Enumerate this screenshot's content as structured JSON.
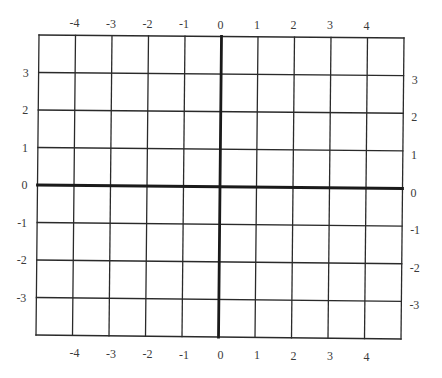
{
  "diagram": {
    "type": "coordinate-grid",
    "columns": 10,
    "rows": 8,
    "colors": {
      "background": "#ffffff",
      "grid_line": "#2a2a2a",
      "axis_line": "#1a1a1a",
      "label": "#3a3a3a"
    },
    "x_axis": {
      "top_labels": [
        "-4",
        "-3",
        "-2",
        "-1",
        "0",
        "1",
        "2",
        "3",
        "4"
      ],
      "bottom_labels": [
        "-4",
        "-3",
        "-2",
        "-1",
        "0",
        "1",
        "2",
        "3",
        "4"
      ]
    },
    "y_axis": {
      "left_labels": [
        "3",
        "2",
        "1",
        "0",
        "-1",
        "-2",
        "-3"
      ],
      "right_labels": [
        "3",
        "2",
        "1",
        "0",
        "-1",
        "-2",
        "-3"
      ]
    }
  }
}
